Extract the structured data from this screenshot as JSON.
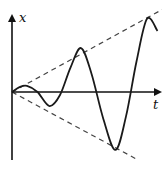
{
  "chart_data": {
    "type": "line",
    "title": "",
    "xlabel": "t",
    "ylabel": "x",
    "series": [
      {
        "name": "oscillation",
        "style": "solid",
        "color": "#1a1a1a",
        "x": [
          0,
          0.05,
          0.1,
          0.17,
          0.25,
          0.32,
          0.39,
          0.46,
          0.53,
          0.61,
          0.69,
          0.76,
          0.83,
          0.9,
          0.97
        ],
        "y": [
          0,
          0.08,
          0.1,
          0.0,
          -0.23,
          -0.05,
          0.4,
          0.72,
          0.3,
          -0.45,
          -0.95,
          -0.4,
          0.5,
          1.2,
          1.0
        ]
      },
      {
        "name": "upper-envelope",
        "style": "dashed",
        "color": "#444444",
        "x": [
          0,
          1.0
        ],
        "y": [
          0,
          1.35
        ]
      },
      {
        "name": "lower-envelope",
        "style": "dashed",
        "color": "#444444",
        "x": [
          0,
          0.83
        ],
        "y": [
          0,
          -1.1
        ]
      }
    ],
    "xlim": [
      0,
      1.0
    ],
    "ylim": [
      -1.1,
      1.35
    ],
    "grid": false,
    "legend": "none"
  }
}
